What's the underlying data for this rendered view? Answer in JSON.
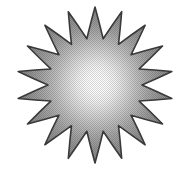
{
  "image": {
    "kind": "clipart-illustration",
    "subject_name": "sunburst-star",
    "title": "Sunburst star",
    "alt_text": "A grey starburst sun with many sharp pointed rays and a bright glowing white centre",
    "width": 184,
    "height": 182,
    "background_color": "#ffffff"
  },
  "starburst": {
    "name": "sunburst-star",
    "point_count": 18,
    "center_x": 95,
    "center_y": 85,
    "outer_radius": 78,
    "inner_radius": 47,
    "bounds": {
      "left": 18,
      "top": 10,
      "right": 172,
      "bottom": 165
    },
    "rotation_deg": -90,
    "outline": {
      "name": "star-outline",
      "color": "#3a3a3a",
      "width": 1.6
    },
    "gradient": {
      "name": "radial-glow-gradient",
      "type": "radial",
      "center_x": 95,
      "center_y": 85,
      "focus_x": 97,
      "focus_y": 83,
      "radius": 82,
      "stops": [
        {
          "offset": 0.0,
          "color": "#ffffff"
        },
        {
          "offset": 0.12,
          "color": "#fdfdfd"
        },
        {
          "offset": 0.24,
          "color": "#f0f0f0"
        },
        {
          "offset": 0.38,
          "color": "#d8d8d8"
        },
        {
          "offset": 0.52,
          "color": "#bdbdbd"
        },
        {
          "offset": 0.66,
          "color": "#a6a6a6"
        },
        {
          "offset": 0.8,
          "color": "#949494"
        },
        {
          "offset": 0.92,
          "color": "#8a8a8a"
        },
        {
          "offset": 1.0,
          "color": "#828282"
        }
      ]
    },
    "texture": {
      "name": "halftone-dither-texture",
      "enabled": true,
      "cell_size": 2,
      "dot_color": "#000000",
      "opacity": 0.16
    },
    "points": [
      {
        "index": 0,
        "tip_x": 95,
        "tip_y": 10
      },
      {
        "index": 1,
        "tip_x": 121,
        "tip_y": 16
      },
      {
        "index": 2,
        "tip_x": 143,
        "tip_y": 31
      },
      {
        "index": 3,
        "tip_x": 160,
        "tip_y": 52
      },
      {
        "index": 4,
        "tip_x": 170,
        "tip_y": 77
      },
      {
        "index": 5,
        "tip_x": 172,
        "tip_y": 104
      },
      {
        "index": 6,
        "tip_x": 161,
        "tip_y": 128
      },
      {
        "index": 7,
        "tip_x": 143,
        "tip_y": 147
      },
      {
        "index": 8,
        "tip_x": 120,
        "tip_y": 159
      },
      {
        "index": 9,
        "tip_x": 95,
        "tip_y": 165
      },
      {
        "index": 10,
        "tip_x": 69,
        "tip_y": 159
      },
      {
        "index": 11,
        "tip_x": 46,
        "tip_y": 147
      },
      {
        "index": 12,
        "tip_x": 28,
        "tip_y": 128
      },
      {
        "index": 13,
        "tip_x": 19,
        "tip_y": 104
      },
      {
        "index": 14,
        "tip_x": 18,
        "tip_y": 77
      },
      {
        "index": 15,
        "tip_x": 29,
        "tip_y": 52
      },
      {
        "index": 16,
        "tip_x": 46,
        "tip_y": 31
      },
      {
        "index": 17,
        "tip_x": 69,
        "tip_y": 16
      }
    ]
  }
}
